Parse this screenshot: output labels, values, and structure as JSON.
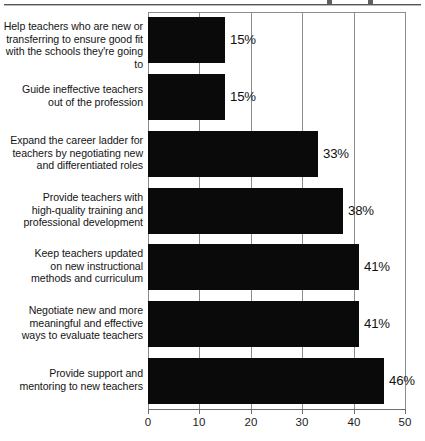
{
  "chart_data": {
    "type": "bar",
    "orientation": "horizontal",
    "title": "",
    "xlabel": "",
    "ylabel": "",
    "xlim": [
      0,
      50
    ],
    "xticks": [
      0,
      10,
      20,
      30,
      40,
      50
    ],
    "grid": true,
    "legend": false,
    "value_suffix": "%",
    "bar_color": "#0a0a0a",
    "grid_color": "#8c8c8c",
    "categories": [
      "Help teachers who are new or transferring to ensure good fit with the schools they're going to",
      "Guide ineffective teachers out of the profession",
      "Expand the career ladder for teachers by negotiating new and differentiated roles",
      "Provide teachers with high-quality training and professional development",
      "Keep teachers updated on new instructional methods and curriculum",
      "Negotiate new and more meaningful and effective ways to evaluate teachers",
      "Provide support and mentoring to new teachers"
    ],
    "category_lines": [
      [
        "Help teachers who are new or",
        "transferring to ensure good fit",
        "with the schools they're going to"
      ],
      [
        "Guide ineffective teachers",
        "out of the profession"
      ],
      [
        "Expand the career ladder for",
        "teachers by negotiating new",
        "and differentiated roles"
      ],
      [
        "Provide teachers with",
        "high-quality training and",
        "professional development"
      ],
      [
        "Keep teachers updated",
        "on new instructional",
        "methods and curriculum"
      ],
      [
        "Negotiate new and more",
        "meaningful and effective",
        "ways to evaluate teachers"
      ],
      [
        "Provide support and",
        "mentoring to new teachers"
      ]
    ],
    "values": [
      15,
      15,
      33,
      38,
      41,
      41,
      46
    ],
    "value_labels": [
      "15%",
      "15%",
      "33%",
      "38%",
      "41%",
      "41%",
      "46%"
    ]
  },
  "axis": {
    "tick_labels": [
      "0",
      "10",
      "20",
      "30",
      "40",
      "50"
    ]
  }
}
